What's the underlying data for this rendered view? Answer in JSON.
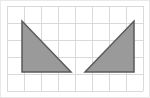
{
  "figure": {
    "width": 150,
    "height": 98,
    "background_color": "#ffffff",
    "border_color": "#e9e9e9"
  },
  "grid": {
    "label": "square grid",
    "line_color": "#d9d9d9",
    "line_width": 1,
    "cell_size": 17,
    "columns": 8,
    "rows": 5,
    "origin_x": 7,
    "origin_y": 6,
    "right_x": 143,
    "bottom_y": 91
  },
  "chart_data": {
    "type": "scatter",
    "xlabel": "",
    "ylabel": "",
    "xlim": [
      0,
      8
    ],
    "ylim": [
      0,
      5
    ],
    "grid": true,
    "legend_position": "none",
    "shapes": [
      {
        "name": "left-triangle",
        "kind": "right triangle",
        "fill": "#9a9a9a",
        "stroke": "#5a5a5a",
        "stroke_width": 1.5,
        "orientation": "right angle at bottom-left, hypotenuse falls left-to-right",
        "grid_vertices": [
          [
            1,
            4
          ],
          [
            1,
            1
          ],
          [
            4.7,
            1
          ]
        ],
        "pixel_vertices": [
          [
            22,
            21
          ],
          [
            22,
            72
          ],
          [
            71,
            72
          ]
        ],
        "legs": {
          "vertical": 3,
          "horizontal": 3.7
        }
      },
      {
        "name": "right-triangle",
        "kind": "right triangle",
        "fill": "#9a9a9a",
        "stroke": "#5a5a5a",
        "stroke_width": 1.5,
        "orientation": "right angle at bottom-right, hypotenuse rises left-to-right",
        "grid_vertices": [
          [
            7.5,
            4
          ],
          [
            7.5,
            1
          ],
          [
            4.6,
            1
          ]
        ],
        "pixel_vertices": [
          [
            134,
            21
          ],
          [
            134,
            72
          ],
          [
            85,
            72
          ]
        ],
        "legs": {
          "vertical": 3,
          "horizontal": 2.9
        }
      }
    ],
    "series": [
      {
        "name": "left-triangle",
        "x": [
          1,
          1,
          4.7,
          1
        ],
        "y": [
          4,
          1,
          1,
          4
        ]
      },
      {
        "name": "right-triangle",
        "x": [
          7.5,
          7.5,
          4.6,
          7.5
        ],
        "y": [
          4,
          1,
          1,
          4
        ]
      }
    ]
  }
}
